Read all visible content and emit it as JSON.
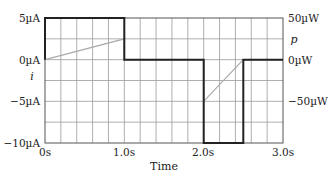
{
  "chart_data": {
    "type": "line",
    "title": "",
    "xlabel": "Time",
    "ylabel_left": "i",
    "ylabel_right": "p",
    "xlim": [
      0,
      3.0
    ],
    "ylim_left": [
      -10,
      5
    ],
    "ylim_right": [
      -100,
      50
    ],
    "grid": true,
    "x_ticks": [
      "0s",
      "1.0s",
      "2.0s",
      "3.0s"
    ],
    "y_ticks_left": [
      "5µA",
      "0µA",
      "-5µA",
      "-10µA"
    ],
    "y_ticks_right": [
      "50µW",
      "0µW",
      "-50µW"
    ],
    "series": [
      {
        "name": "i (current)",
        "axis": "left",
        "unit": "µA",
        "color": "#222222",
        "x": [
          0,
          0,
          1.0,
          1.0,
          2.0,
          2.0,
          2.5,
          2.5,
          3.0
        ],
        "values": [
          0,
          5,
          5,
          0,
          0,
          -10,
          -10,
          0,
          0
        ]
      },
      {
        "name": "p (power)",
        "axis": "right",
        "unit": "µW",
        "color": "#aaaaaa",
        "x": [
          0,
          1.0,
          1.0,
          2.0,
          2.0,
          2.5,
          3.0
        ],
        "values": [
          0,
          25,
          0,
          0,
          -50,
          0,
          0
        ]
      }
    ]
  },
  "labels": {
    "x_tick_0": "0s",
    "x_tick_1": "1.0s",
    "x_tick_2": "2.0s",
    "x_tick_3": "3.0s",
    "y_left_5": "5µA",
    "y_left_0": "0µA",
    "y_left_m5": "−5µA",
    "y_left_m10": "−10µA",
    "y_right_50": "50µW",
    "y_right_0": "0µW",
    "y_right_m50": "−50µW",
    "left_var": "i",
    "right_var": "p",
    "xlabel": "Time"
  }
}
